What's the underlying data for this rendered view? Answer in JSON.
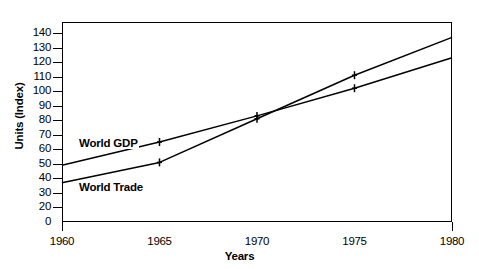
{
  "chart_data": {
    "type": "line",
    "title": "",
    "xlabel": "Years",
    "ylabel": "Units (Index)",
    "x": [
      1960,
      1965,
      1970,
      1975,
      1980
    ],
    "xtick_labels": [
      "1960",
      "1965",
      "1970",
      "1975",
      "1980"
    ],
    "xlim": [
      1960,
      1980
    ],
    "ylim": [
      0,
      148
    ],
    "ytick_labels": [
      "140",
      "130",
      "120",
      "110",
      "100",
      "90",
      "80",
      "70",
      "60",
      "50",
      "40",
      "30",
      "20",
      "0"
    ],
    "ytick_values": [
      140,
      130,
      120,
      110,
      100,
      90,
      80,
      70,
      60,
      50,
      40,
      30,
      20,
      0
    ],
    "grid": false,
    "legend": "inline-labels",
    "marker": "plus",
    "series": [
      {
        "name": "World GDP",
        "values": [
          49,
          65,
          83,
          102,
          123
        ],
        "color": "#000000"
      },
      {
        "name": "World Trade",
        "values": [
          37,
          51,
          81,
          111,
          137
        ],
        "color": "#000000"
      }
    ],
    "annotations": [
      {
        "text": "World GDP",
        "series": "World GDP"
      },
      {
        "text": "World Trade",
        "series": "World Trade"
      }
    ]
  },
  "axis": {
    "y_title": "Units (Index)",
    "x_title": "Years"
  },
  "colors": {
    "line": "#000000",
    "frame": "#000000",
    "background": "#ffffff"
  }
}
